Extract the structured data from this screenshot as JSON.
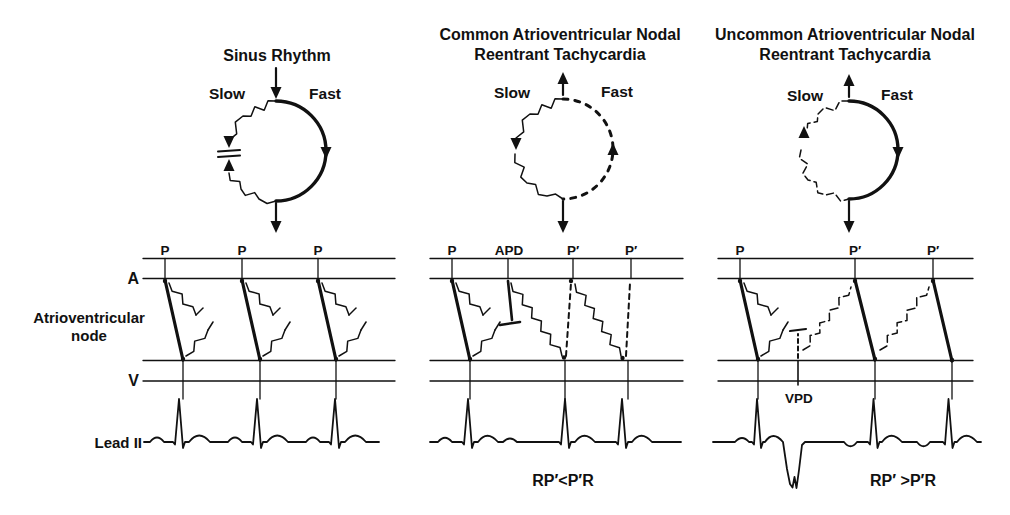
{
  "figure": {
    "background": "#ffffff",
    "ink_color": "#111111"
  },
  "panels": [
    {
      "id": "sinus-rhythm",
      "title_lines": [
        "Sinus Rhythm"
      ],
      "slow_label": "Slow",
      "fast_label": "Fast",
      "wave_labels": [
        "P",
        "P",
        "P"
      ],
      "caption": ""
    },
    {
      "id": "common-avnrt",
      "title_lines": [
        "Common Atrioventricular Nodal",
        "Reentrant Tachycardia"
      ],
      "slow_label": "Slow",
      "fast_label": "Fast",
      "wave_labels": [
        "P",
        "APD",
        "P′",
        "P′"
      ],
      "caption": "RP′<P′R"
    },
    {
      "id": "uncommon-avnrt",
      "title_lines": [
        "Uncommon Atrioventricular Nodal",
        "Reentrant Tachycardia"
      ],
      "slow_label": "Slow",
      "fast_label": "Fast",
      "wave_labels": [
        "P",
        "P′",
        "P′"
      ],
      "vpd_label": "VPD",
      "caption": "RP′ >P′R"
    }
  ],
  "ladder": {
    "atrial_label": "A",
    "ventricular_label": "V",
    "node_label_lines": [
      "Atrioventricular",
      "node"
    ],
    "ecg_lead_label": "Lead II"
  }
}
